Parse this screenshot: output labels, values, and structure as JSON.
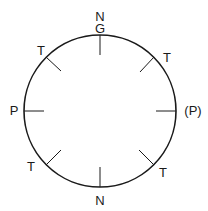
{
  "diagram": {
    "circle": {
      "cx": 100,
      "cy": 111,
      "r": 76,
      "stroke": "#1a1a1a"
    },
    "tick_length": 20,
    "labels": {
      "top_n": "N",
      "top_g": "G",
      "upper_left_t": "T",
      "upper_right_t": "T",
      "left_p": "P",
      "right_p": "(P)",
      "lower_left_t": "T",
      "lower_right_t": "T",
      "bottom_n": "N"
    }
  }
}
